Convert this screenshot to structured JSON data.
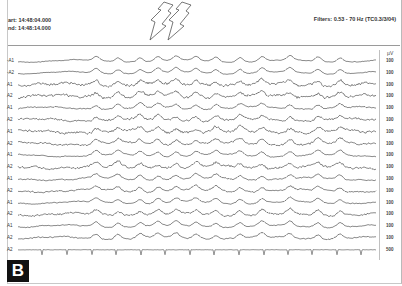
{
  "header": {
    "start_label": "art: 14:48:04.000",
    "end_label": "nd: 14:48:14.000",
    "filters": "Filters: 0.53 - 70 Hz  (TC0.3/3/04)"
  },
  "unit_label": "µV",
  "panel_label": "B",
  "annotations": {
    "arrows": [
      {
        "name": "arrow-1",
        "x": 160,
        "tip_y": 40
      },
      {
        "name": "arrow-2",
        "x": 178,
        "tip_y": 40
      }
    ]
  },
  "chart_data": {
    "type": "line",
    "title": "",
    "x_range": [
      0,
      10
    ],
    "xlabel": "time (s)",
    "time_start": "14:48:04.000",
    "time_end": "14:48:14.000",
    "filters": "0.53 - 70 Hz",
    "grid": false,
    "legend": "none",
    "channels": [
      {
        "label": "-A1",
        "scale_uv": "100",
        "noise": 0.3
      },
      {
        "label": "-A2",
        "scale_uv": "100",
        "noise": 0.3
      },
      {
        "label": "A1",
        "scale_uv": "100",
        "noise": 1.0
      },
      {
        "label": "A2",
        "scale_uv": "100",
        "noise": 1.0
      },
      {
        "label": "A1",
        "scale_uv": "100",
        "noise": 0.5
      },
      {
        "label": "A2",
        "scale_uv": "100",
        "noise": 0.8
      },
      {
        "label": "A1",
        "scale_uv": "100",
        "noise": 1.0
      },
      {
        "label": "A2",
        "scale_uv": "100",
        "noise": 0.8
      },
      {
        "label": "A1",
        "scale_uv": "100",
        "noise": 0.4
      },
      {
        "label": "A2",
        "scale_uv": "100",
        "noise": 0.9
      },
      {
        "label": "A1",
        "scale_uv": "100",
        "noise": 0.5
      },
      {
        "label": "A2",
        "scale_uv": "100",
        "noise": 0.6
      },
      {
        "label": "A1",
        "scale_uv": "100",
        "noise": 0.4
      },
      {
        "label": "A2",
        "scale_uv": "100",
        "noise": 0.7
      },
      {
        "label": "A1",
        "scale_uv": "100",
        "noise": 0.4
      },
      {
        "label": "A2",
        "scale_uv": "100",
        "noise": 0.5
      },
      {
        "label": "A2",
        "scale_uv": "500",
        "noise": 0.1,
        "ecg": true
      }
    ],
    "slow_wave_peaks_x_px": [
      96,
      118,
      140,
      158,
      176,
      196,
      216,
      240,
      262,
      290,
      318,
      340
    ],
    "ecg_beats_x_px": [
      42,
      67,
      92,
      116,
      141,
      165,
      190,
      214,
      239,
      264,
      288,
      312,
      337,
      361
    ]
  }
}
